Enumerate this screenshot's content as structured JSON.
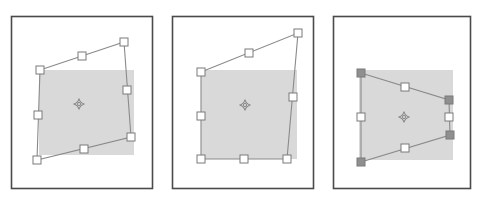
{
  "figure": {
    "caption": "",
    "background_color": "#ffffff",
    "width": 479,
    "height": 204,
    "panel_count": 3
  },
  "style": {
    "frame_stroke": "#4a4a4a",
    "frame_fill": "#ffffff",
    "frame_stroke_width": 1.6,
    "shade_fill": "#d9d9d9",
    "cage_stroke": "#8a8a8a",
    "handle_stroke": "#7a7a7a",
    "handle_fill_empty": "#ffffff",
    "handle_fill_selected": "#8f8f8f",
    "pivot_stroke": "#8a8a8a",
    "handle_size": 8,
    "pivot_size": 11
  },
  "panels": [
    {
      "id": "panel-1",
      "label": "",
      "frame": {
        "x": 11,
        "y": 16,
        "width": 141,
        "height": 172
      },
      "shaded_rect": {
        "x": 39,
        "y": 70,
        "width": 95,
        "height": 85
      },
      "pivot": {
        "x": 79,
        "y": 104
      },
      "cage": {
        "type": "quadrilateral",
        "corners": [
          {
            "name": "top-left",
            "x": 40,
            "y": 70,
            "selected": false
          },
          {
            "name": "top-right",
            "x": 124,
            "y": 42,
            "selected": false
          },
          {
            "name": "bottom-right",
            "x": 131,
            "y": 137,
            "selected": false
          },
          {
            "name": "bottom-left",
            "x": 37,
            "y": 160,
            "selected": false
          }
        ],
        "midpoints": [
          {
            "name": "top",
            "x": 82,
            "y": 56,
            "selected": false
          },
          {
            "name": "right",
            "x": 127,
            "y": 90,
            "selected": false
          },
          {
            "name": "bottom",
            "x": 84,
            "y": 149,
            "selected": false
          },
          {
            "name": "left",
            "x": 38,
            "y": 115,
            "selected": false
          }
        ]
      }
    },
    {
      "id": "panel-2",
      "label": "",
      "frame": {
        "x": 172,
        "y": 16,
        "width": 141,
        "height": 172
      },
      "shaded_rect": {
        "x": 201,
        "y": 70,
        "width": 96,
        "height": 89
      },
      "pivot": {
        "x": 245,
        "y": 105
      },
      "cage": {
        "type": "quadrilateral",
        "corners": [
          {
            "name": "top-left",
            "x": 201,
            "y": 72,
            "selected": false
          },
          {
            "name": "top-right",
            "x": 298,
            "y": 33,
            "selected": false
          },
          {
            "name": "bottom-right",
            "x": 287,
            "y": 159,
            "selected": false
          },
          {
            "name": "bottom-left",
            "x": 201,
            "y": 159,
            "selected": false
          }
        ],
        "midpoints": [
          {
            "name": "top",
            "x": 249,
            "y": 53,
            "selected": false
          },
          {
            "name": "right",
            "x": 293,
            "y": 97,
            "selected": false
          },
          {
            "name": "bottom",
            "x": 244,
            "y": 159,
            "selected": false
          },
          {
            "name": "left",
            "x": 201,
            "y": 116,
            "selected": false
          }
        ]
      }
    },
    {
      "id": "panel-3",
      "label": "",
      "frame": {
        "x": 333,
        "y": 16,
        "width": 137,
        "height": 172
      },
      "shaded_rect": {
        "x": 359,
        "y": 70,
        "width": 94,
        "height": 90
      },
      "pivot": {
        "x": 404,
        "y": 117
      },
      "cage": {
        "type": "quadrilateral",
        "corners": [
          {
            "name": "top-left",
            "x": 361,
            "y": 73,
            "selected": true
          },
          {
            "name": "top-right",
            "x": 449,
            "y": 100,
            "selected": true
          },
          {
            "name": "bottom-right",
            "x": 450,
            "y": 135,
            "selected": true
          },
          {
            "name": "bottom-left",
            "x": 361,
            "y": 162,
            "selected": true
          }
        ],
        "midpoints": [
          {
            "name": "top",
            "x": 405,
            "y": 87,
            "selected": false
          },
          {
            "name": "right",
            "x": 449,
            "y": 117,
            "selected": false
          },
          {
            "name": "bottom",
            "x": 405,
            "y": 148,
            "selected": false
          },
          {
            "name": "left",
            "x": 361,
            "y": 117,
            "selected": false
          }
        ]
      }
    }
  ]
}
